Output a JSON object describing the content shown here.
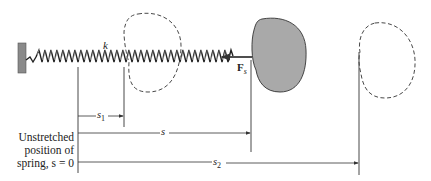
{
  "diagram": {
    "labels": {
      "spring_constant": "k",
      "force": "F",
      "force_subscript": "s",
      "s1": "s",
      "s1_sub": "1",
      "s": "s",
      "s2": "s",
      "s2_sub": "2",
      "unstretched_line1": "Unstretched",
      "unstretched_line2": "position of",
      "unstretched_line3": "spring, s = 0"
    },
    "colors": {
      "body_fill": "#a9a9a9",
      "line": "#333333",
      "wall": "#8a8a8a"
    },
    "elements": [
      {
        "name": "wall",
        "type": "fixed support"
      },
      {
        "name": "spring",
        "type": "coil spring",
        "label": "k"
      },
      {
        "name": "body-initial",
        "type": "dashed outline",
        "position": "s1"
      },
      {
        "name": "body-current",
        "type": "shaded body",
        "position": "s"
      },
      {
        "name": "body-final",
        "type": "dashed outline",
        "position": "s2"
      }
    ],
    "dimensions": [
      {
        "label": "s1",
        "from": "s = 0",
        "to": "initial position"
      },
      {
        "label": "s",
        "from": "s = 0",
        "to": "current position"
      },
      {
        "label": "s2",
        "from": "s = 0",
        "to": "final position"
      }
    ]
  }
}
